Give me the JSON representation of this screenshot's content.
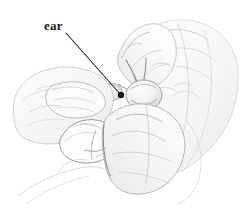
{
  "figure": {
    "name": "hands-holding-specimen-illustration",
    "medium": "pencil-line-drawing",
    "background_color": "#ffffff",
    "width": 242,
    "height": 220,
    "caption": ""
  },
  "annotations": {
    "labels": [
      {
        "id": "ear",
        "text": "ear",
        "color": "#1a1a1a",
        "text_x": 44,
        "text_y": 19,
        "leader": {
          "from_x": 66,
          "from_y": 33,
          "to_x": 121,
          "to_y": 95,
          "color": "#262626",
          "width": 1.1,
          "terminal": "dot",
          "terminal_radius": 3.2
        }
      }
    ]
  },
  "drawing": {
    "stroke_colors": {
      "outline_dark": "#5d5d5d",
      "outline_mid": "#8c8c8c",
      "outline_light": "#b8b8b8",
      "hatch_faint": "#cfcfcf",
      "shadow_deep": "#3f3f3f"
    },
    "fills": {
      "paper": "#ffffff",
      "tint_pale": "#f7f7f7",
      "tint_soft": "#efefef",
      "tint_grey": "#e4e4e4"
    }
  }
}
